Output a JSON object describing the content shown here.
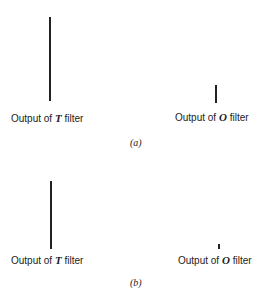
{
  "panels": [
    {
      "caption": "(a)",
      "t_filter": {
        "prefix": "Output of ",
        "symbol": "T",
        "suffix": " filter",
        "line_height": 84
      },
      "o_filter": {
        "prefix": "Output of ",
        "symbol": "O",
        "suffix": " filter",
        "line_height": 18
      }
    },
    {
      "caption": "(b)",
      "t_filter": {
        "prefix": "Output of ",
        "symbol": "T",
        "suffix": " filter",
        "line_height": 68
      },
      "o_filter": {
        "prefix": "Output of ",
        "symbol": "O",
        "suffix": " filter",
        "line_height": 5
      }
    }
  ]
}
